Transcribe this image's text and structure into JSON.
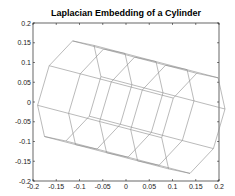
{
  "chart_data": {
    "type": "line",
    "title": "Laplacian Embedding of a Cylinder",
    "xlabel": "",
    "ylabel": "",
    "xlim": [
      -0.2,
      0.2
    ],
    "ylim": [
      -0.2,
      0.2
    ],
    "grid": false,
    "legend": null,
    "x_ticks": [
      "-0.2",
      "-0.15",
      "-0.1",
      "-0.05",
      "0",
      "0.05",
      "0.1",
      "0.15",
      "0.2"
    ],
    "y_ticks": [
      "0.2",
      "0.15",
      "0.1",
      "0.05",
      "0",
      "-0.05",
      "-0.1",
      "-0.15",
      "-0.2"
    ],
    "mesh": {
      "rings": 5,
      "points_per_ring": 8,
      "ring_center_start": [
        -0.122,
        0.028
      ],
      "ring_step": [
        0.0667,
        -0.0205
      ],
      "ring_radius_x": 0.062,
      "ring_radius_y": 0.135,
      "ring_tilt_deg": -14
    },
    "line_color": "#8c8c8c"
  },
  "colors": {
    "axis": "#000000",
    "background": "#ffffff"
  }
}
